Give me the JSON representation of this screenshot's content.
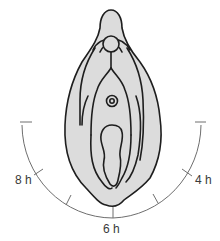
{
  "diagram": {
    "type": "anatomical clock-position diagram",
    "colors": {
      "fill": "#dcdcdc",
      "outline": "#1e1e1e",
      "scale_line": "#6e6e6e",
      "label_text": "#3a3a3a",
      "background": "#ffffff"
    },
    "scale": {
      "labels": [
        {
          "id": "8h",
          "text": "8 h"
        },
        {
          "id": "6h",
          "text": "6 h"
        },
        {
          "id": "4h",
          "text": "4 h"
        }
      ]
    }
  }
}
